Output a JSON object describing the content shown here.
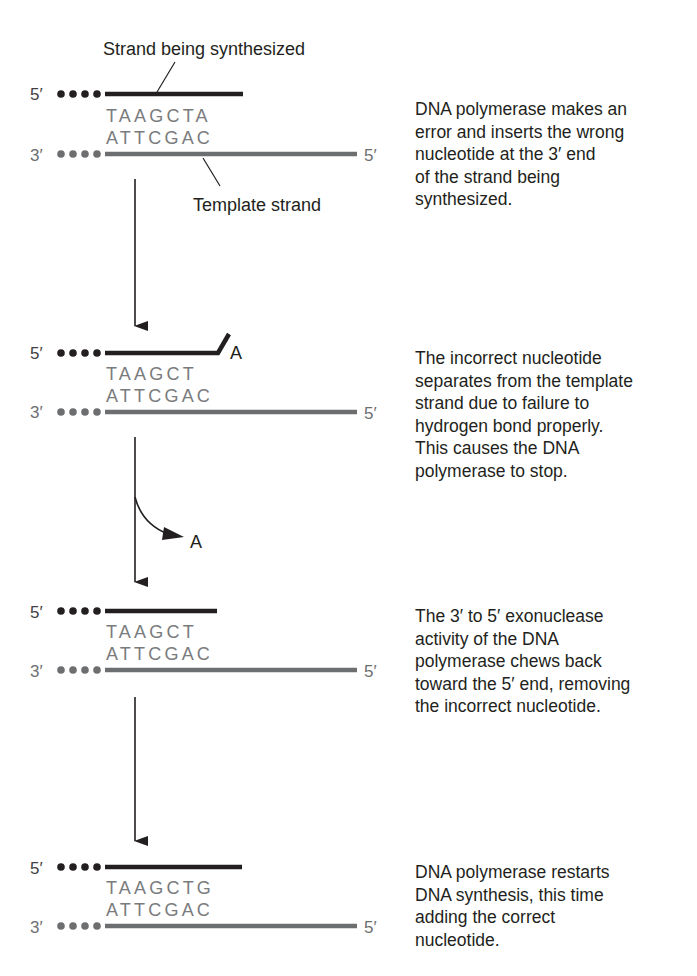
{
  "colors": {
    "synth_strand": "#231f20",
    "template_strand": "#6d6e70",
    "base_letters": "#7a7b7d",
    "label_text": "#231f20",
    "arrow": "#231f20"
  },
  "labels": {
    "synth_strand": "Strand being synthesized",
    "template_strand": "Template strand",
    "prime5": "5′",
    "prime3": "3′",
    "removed_nucleotide": "A"
  },
  "steps": [
    {
      "top_seq": "TAAGCTA",
      "bottom_seq": "ATTCGAC",
      "flipped_base": "",
      "description": [
        "DNA polymerase makes an",
        "error and inserts the wrong",
        "nucleotide at the 3′ end",
        "of the strand being",
        "synthesized."
      ]
    },
    {
      "top_seq": "TAAGCT",
      "bottom_seq": "ATTCGAC",
      "flipped_base": "A",
      "description": [
        "The incorrect nucleotide",
        "separates from the template",
        "strand due to failure to",
        "hydrogen bond properly.",
        "This causes the DNA",
        "polymerase to stop."
      ]
    },
    {
      "top_seq": "TAAGCT",
      "bottom_seq": "ATTCGAC",
      "flipped_base": "",
      "description": [
        "The 3′ to 5′ exonuclease",
        "activity of the DNA",
        "polymerase chews back",
        "toward the 5′ end, removing",
        "the incorrect nucleotide."
      ]
    },
    {
      "top_seq": "TAAGCTG",
      "bottom_seq": "ATTCGAC",
      "flipped_base": "",
      "description": [
        "DNA polymerase restarts",
        "DNA synthesis, this time",
        "adding the correct",
        "nucleotide."
      ]
    }
  ]
}
